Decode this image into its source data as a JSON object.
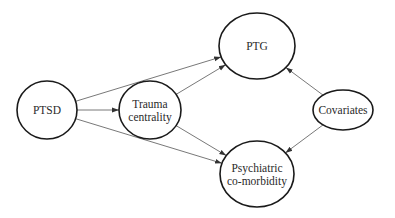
{
  "diagram": {
    "type": "path-model",
    "nodes": [
      {
        "id": "ptsd",
        "lines": [
          "PTSD"
        ],
        "cx": 47,
        "cy": 110,
        "rx": 30,
        "ry": 29
      },
      {
        "id": "trauma",
        "lines": [
          "Trauma",
          "centrality"
        ],
        "cx": 150,
        "cy": 110,
        "rx": 31,
        "ry": 29
      },
      {
        "id": "ptg",
        "lines": [
          "PTG"
        ],
        "cx": 257,
        "cy": 46,
        "rx": 38,
        "ry": 33
      },
      {
        "id": "psych",
        "lines": [
          "Psychiatric",
          "co-morbidity"
        ],
        "cx": 257,
        "cy": 174,
        "rx": 37,
        "ry": 33
      },
      {
        "id": "cov",
        "lines": [
          "Covariates"
        ],
        "cx": 343,
        "cy": 110,
        "rx": 30,
        "ry": 20
      }
    ],
    "edges": [
      {
        "from": "ptsd",
        "to": "trauma"
      },
      {
        "from": "ptsd",
        "to": "ptg"
      },
      {
        "from": "ptsd",
        "to": "psych"
      },
      {
        "from": "trauma",
        "to": "ptg"
      },
      {
        "from": "trauma",
        "to": "psych"
      },
      {
        "from": "cov",
        "to": "ptg"
      },
      {
        "from": "cov",
        "to": "psych"
      }
    ],
    "colors": {
      "stroke": "#1a1a1a",
      "edge": "#555555",
      "text": "#2a2a2a",
      "background": "#ffffff"
    }
  }
}
